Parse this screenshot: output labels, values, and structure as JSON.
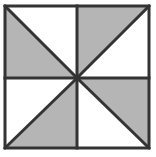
{
  "figure": {
    "name": "pinwheel-square-figure",
    "title": "Pinwheel square divided into eight triangles",
    "canvas": {
      "width": 156,
      "height": 157,
      "background_color": "#ffffff"
    },
    "frame": {
      "x": 5,
      "y": 6,
      "width": 144,
      "height": 142,
      "stroke_color": "#333333",
      "stroke_width": 3,
      "fill_color": "#ffffff"
    },
    "divider_lines": {
      "stroke_color": "#333333",
      "stroke_width": 3,
      "vertical": {
        "x": 77,
        "y1": 6,
        "y2": 148
      },
      "horizontal": {
        "y": 78,
        "x1": 5,
        "x2": 149
      }
    },
    "diagonal_lines": {
      "stroke_color": "#333333",
      "stroke_width": 3,
      "segments": [
        {
          "name": "top-left-diagonal",
          "x1": 5,
          "y1": 6,
          "x2": 77,
          "y2": 78
        },
        {
          "name": "top-right-diagonal",
          "x1": 77,
          "y1": 78,
          "x2": 149,
          "y2": 6
        },
        {
          "name": "bottom-left-diagonal",
          "x1": 5,
          "y1": 148,
          "x2": 77,
          "y2": 78
        },
        {
          "name": "bottom-right-diagonal",
          "x1": 77,
          "y1": 78,
          "x2": 149,
          "y2": 148
        }
      ]
    },
    "fill_colors": {
      "shaded": "#b5b5b5",
      "unshaded": "#ffffff"
    },
    "center_point": {
      "x": 77,
      "y": 78
    },
    "shaded_count": 4,
    "unshaded_count": 4,
    "triangles": [
      {
        "name": "top-left-lower-triangle",
        "quadrant": "top-left",
        "position": "lower-left",
        "shaded": true,
        "points": "5,6 5,78 77,78"
      },
      {
        "name": "top-left-upper-triangle",
        "quadrant": "top-left",
        "position": "upper-right",
        "shaded": false,
        "points": "5,6 77,6 77,78"
      },
      {
        "name": "top-right-upper-triangle",
        "quadrant": "top-right",
        "position": "upper-left",
        "shaded": true,
        "points": "77,6 149,6 77,78"
      },
      {
        "name": "top-right-lower-triangle",
        "quadrant": "top-right",
        "position": "lower-right",
        "shaded": false,
        "points": "149,6 149,78 77,78"
      },
      {
        "name": "bottom-left-upper-triangle",
        "quadrant": "bottom-left",
        "position": "upper-left",
        "shaded": false,
        "points": "5,78 77,78 5,148"
      },
      {
        "name": "bottom-left-lower-triangle",
        "quadrant": "bottom-left",
        "position": "lower-right",
        "shaded": true,
        "points": "77,78 77,148 5,148"
      },
      {
        "name": "bottom-right-upper-triangle",
        "quadrant": "bottom-right",
        "position": "upper-right",
        "shaded": true,
        "points": "77,78 149,78 149,148"
      },
      {
        "name": "bottom-right-lower-triangle",
        "quadrant": "bottom-right",
        "position": "lower-left",
        "shaded": false,
        "points": "77,78 149,148 77,148"
      }
    ]
  }
}
